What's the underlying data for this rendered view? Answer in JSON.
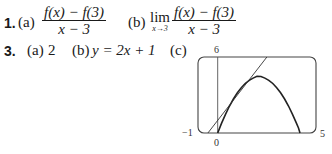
{
  "problems": [
    {
      "number": "1.",
      "parts": [
        {
          "label": "(a)",
          "numerator": "f(x) − f(3)",
          "denominator": "x − 3"
        },
        {
          "label": "(b)",
          "lim": "lim",
          "lim_sub": "x→3",
          "numerator": "f(x) − f(3)",
          "denominator": "x − 3"
        }
      ]
    },
    {
      "number": "3.",
      "parts": [
        {
          "label": "(a)",
          "value": "2"
        },
        {
          "label": "(b)",
          "value": "y = 2x + 1"
        },
        {
          "label": "(c)"
        }
      ]
    }
  ],
  "graph": {
    "x_min_label": "−1",
    "x_max_label": "5",
    "y_max_label": "6",
    "origin_label": "0",
    "curve": "y = 4x − x²",
    "tangent": "y = 2x + 1"
  }
}
